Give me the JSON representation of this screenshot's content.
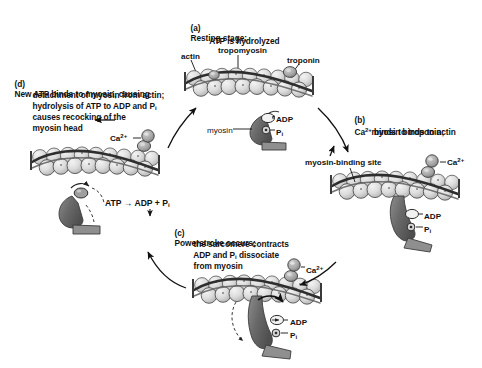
{
  "diagram": {
    "background_color": "#ffffff",
    "actin_color": "#d8d8d8",
    "actin_outline_color": "#4a4a4a",
    "myosin_color": "#6e6e6e",
    "tropomyosin_color": "#3a3a3a",
    "troponin_color": "#9a9a9a",
    "text_color": "#111111"
  },
  "stages": [
    {
      "id": "a",
      "label": "(a)",
      "lines": [
        "Resting stage;",
        "ATP is hydrolyzed"
      ],
      "line1": "Resting stage;",
      "line2": "ATP is hydrolyzed"
    },
    {
      "id": "b",
      "label": "(b)",
      "line1_pre": "Ca",
      "line1_sup": "2+",
      "line1_post": " binds to troponin;",
      "line2": "myosin binds to actin"
    },
    {
      "id": "c",
      "label": "(c)",
      "line1": "Powerstroke occurs;",
      "line2": "the sarcomere contracts",
      "line3_pre": "ADP and P",
      "line3_sub": "i",
      "line3_post": " dissociate",
      "line4": "from myosin"
    },
    {
      "id": "d",
      "label": "(d)",
      "line1": "New ATP binds to myosin, causing",
      "line2": "detachment of myosin from actin;",
      "line3_pre": "hydrolysis of ATP to ADP and P",
      "line3_sub": "i",
      "line4": "causes recocking of the",
      "line5": "myosin head"
    }
  ],
  "labels": {
    "actin": "actin",
    "tropomyosin": "tropomyosin",
    "troponin": "troponin",
    "myosin": "myosin",
    "myosin_binding_site": "myosin-binding site",
    "adp": "ADP",
    "pi_pre": "P",
    "pi_sub": "i",
    "calcium_pre": "Ca",
    "calcium_sup": "2+",
    "atp_reaction_pre": "ATP ",
    "atp_reaction_arrow": "→",
    "atp_reaction_post": " ADP + P",
    "atp_reaction_sub": "i"
  },
  "molecule_labels": {
    "adp": "ADP",
    "pi": "Pi",
    "calcium": "Ca2+"
  }
}
